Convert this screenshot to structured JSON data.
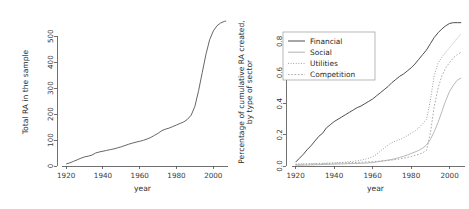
{
  "figure": {
    "width": 469,
    "height": 209,
    "background": "#ffffff",
    "panels": [
      "left-panel",
      "right-panel"
    ]
  },
  "chart_data": [
    {
      "id": "total-ra-chart",
      "type": "line",
      "title": "",
      "xlabel": "year",
      "ylabel": "Total RA in the sample",
      "xlim": [
        1915,
        2008
      ],
      "ylim": [
        0,
        570
      ],
      "xticks": [
        1920,
        1940,
        1960,
        1980,
        2000
      ],
      "yticks": [
        0,
        100,
        200,
        300,
        400,
        500
      ],
      "grid": false,
      "legend": null,
      "series": [
        {
          "name": "Total RA",
          "color": "#555555",
          "style": "solid",
          "width": 0.9,
          "x": [
            1920,
            1922,
            1924,
            1926,
            1928,
            1930,
            1932,
            1934,
            1936,
            1938,
            1940,
            1942,
            1944,
            1946,
            1948,
            1950,
            1952,
            1954,
            1956,
            1958,
            1960,
            1962,
            1964,
            1966,
            1968,
            1970,
            1972,
            1974,
            1976,
            1978,
            1980,
            1982,
            1984,
            1986,
            1988,
            1990,
            1992,
            1994,
            1996,
            1998,
            2000,
            2002,
            2004,
            2006,
            2007
          ],
          "y": [
            8,
            12,
            18,
            24,
            30,
            35,
            38,
            42,
            50,
            54,
            57,
            60,
            63,
            66,
            70,
            74,
            79,
            84,
            88,
            92,
            95,
            99,
            104,
            110,
            118,
            126,
            136,
            142,
            146,
            152,
            158,
            164,
            170,
            180,
            196,
            230,
            290,
            360,
            430,
            486,
            520,
            540,
            551,
            557,
            558
          ]
        }
      ]
    },
    {
      "id": "sector-share-chart",
      "type": "line",
      "title": "",
      "xlabel": "year",
      "ylabel": "Percentage of cumulative RA created, by type of sector",
      "ylabel_lines": [
        "Percentage of cumulative RA created,",
        "by type of sector"
      ],
      "xlim": [
        1915,
        2008
      ],
      "ylim": [
        0.0,
        0.95
      ],
      "xticks": [
        1920,
        1940,
        1960,
        1980,
        2000
      ],
      "yticks": [
        0.0,
        0.2,
        0.4,
        0.6,
        0.8
      ],
      "ytick_labels": [
        "0.0",
        "0.2",
        "0.4",
        "0.6",
        "0.8"
      ],
      "grid": false,
      "legend": {
        "position": "upper-left",
        "entries": [
          {
            "label": "Financial",
            "style": "solid",
            "color": "#3a3a3a"
          },
          {
            "label": "Social",
            "style": "solid",
            "color": "#a8a8a8"
          },
          {
            "label": "Utilities",
            "style": "dotted",
            "color": "#8a8a8a"
          },
          {
            "label": "Competition",
            "style": "dashed",
            "color": "#a0a0a0"
          }
        ]
      },
      "series": [
        {
          "name": "Financial",
          "color": "#3a3a3a",
          "style": "solid",
          "width": 0.9,
          "x": [
            1920,
            1922,
            1924,
            1926,
            1928,
            1930,
            1932,
            1934,
            1936,
            1938,
            1940,
            1942,
            1944,
            1946,
            1948,
            1950,
            1952,
            1954,
            1956,
            1958,
            1960,
            1962,
            1964,
            1966,
            1968,
            1970,
            1972,
            1974,
            1976,
            1978,
            1980,
            1982,
            1984,
            1986,
            1988,
            1990,
            1992,
            1994,
            1996,
            1998,
            2000,
            2002,
            2004,
            2006
          ],
          "y": [
            0.025,
            0.05,
            0.075,
            0.105,
            0.13,
            0.16,
            0.19,
            0.21,
            0.245,
            0.265,
            0.285,
            0.3,
            0.315,
            0.33,
            0.345,
            0.36,
            0.375,
            0.385,
            0.4,
            0.415,
            0.43,
            0.45,
            0.47,
            0.49,
            0.51,
            0.535,
            0.555,
            0.575,
            0.59,
            0.61,
            0.63,
            0.655,
            0.685,
            0.715,
            0.745,
            0.785,
            0.825,
            0.855,
            0.88,
            0.9,
            0.915,
            0.92,
            0.92,
            0.92
          ]
        },
        {
          "name": "Social",
          "color": "#b0b0b0",
          "style": "solid",
          "width": 0.9,
          "x": [
            1920,
            1925,
            1930,
            1935,
            1940,
            1945,
            1950,
            1955,
            1958,
            1960,
            1962,
            1964,
            1966,
            1968,
            1970,
            1972,
            1974,
            1976,
            1978,
            1980,
            1982,
            1984,
            1986,
            1988,
            1990,
            1992,
            1994,
            1996,
            1998,
            2000,
            2002,
            2004,
            2006
          ],
          "y": [
            0.005,
            0.006,
            0.008,
            0.01,
            0.012,
            0.014,
            0.016,
            0.018,
            0.02,
            0.022,
            0.026,
            0.03,
            0.034,
            0.038,
            0.042,
            0.048,
            0.055,
            0.062,
            0.07,
            0.08,
            0.09,
            0.1,
            0.115,
            0.135,
            0.17,
            0.22,
            0.28,
            0.35,
            0.42,
            0.48,
            0.52,
            0.55,
            0.565
          ]
        },
        {
          "name": "Utilities",
          "color": "#8a8a8a",
          "style": "dotted",
          "width": 0.9,
          "x": [
            1920,
            1925,
            1930,
            1935,
            1940,
            1945,
            1950,
            1955,
            1958,
            1960,
            1962,
            1964,
            1966,
            1968,
            1970,
            1972,
            1974,
            1976,
            1978,
            1980,
            1982,
            1984,
            1986,
            1988,
            1990,
            1992,
            1994,
            1996,
            1998,
            2000,
            2002,
            2004,
            2006
          ],
          "y": [
            0.012,
            0.014,
            0.016,
            0.018,
            0.02,
            0.024,
            0.03,
            0.04,
            0.05,
            0.06,
            0.075,
            0.095,
            0.115,
            0.135,
            0.15,
            0.16,
            0.17,
            0.18,
            0.195,
            0.21,
            0.225,
            0.245,
            0.27,
            0.3,
            0.42,
            0.58,
            0.66,
            0.7,
            0.73,
            0.76,
            0.79,
            0.82,
            0.85
          ]
        },
        {
          "name": "Competition",
          "color": "#a0a0a0",
          "style": "dashed",
          "width": 0.9,
          "x": [
            1920,
            1925,
            1930,
            1935,
            1940,
            1945,
            1950,
            1955,
            1960,
            1965,
            1970,
            1974,
            1978,
            1980,
            1982,
            1984,
            1986,
            1988,
            1990,
            1992,
            1994,
            1996,
            1998,
            2000,
            2002,
            2004,
            2006
          ],
          "y": [
            0.01,
            0.012,
            0.014,
            0.016,
            0.018,
            0.02,
            0.022,
            0.025,
            0.028,
            0.032,
            0.038,
            0.045,
            0.055,
            0.06,
            0.068,
            0.075,
            0.085,
            0.1,
            0.21,
            0.38,
            0.5,
            0.58,
            0.63,
            0.665,
            0.695,
            0.715,
            0.73
          ]
        }
      ]
    }
  ]
}
